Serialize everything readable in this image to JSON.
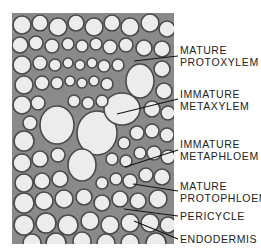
{
  "figure": {
    "labels": [
      {
        "id": "mature-protoxylem",
        "line1": "MATURE",
        "line2": "PROTOXYLEM"
      },
      {
        "id": "immature-metaxylem",
        "line1": "IMMATURE",
        "line2": "METAXYLEM"
      },
      {
        "id": "immature-metaphloem",
        "line1": "IMMATURE",
        "line2": "METAPHLOEM"
      },
      {
        "id": "mature-protophloem",
        "line1": "MATURE",
        "line2": "PROTOPHLOEM"
      },
      {
        "id": "pericycle",
        "line1": "PERICYCLE"
      },
      {
        "id": "endodermis",
        "line1": "ENDODERMIS"
      }
    ]
  },
  "colors": {
    "background": "#ffffff",
    "cell_wall": "#555555",
    "cell_lumen": "#eeeeee",
    "label_text": "#222222",
    "leader_line": "#111111"
  }
}
